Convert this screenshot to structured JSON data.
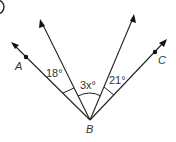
{
  "problem_number_marker": "",
  "vertex": {
    "label": "B",
    "x": 90,
    "y": 120
  },
  "rays": [
    {
      "name": "ray-ba",
      "end": [
        12,
        43
      ],
      "point": {
        "label": "A",
        "at": [
          26,
          56
        ],
        "label_at": [
          19,
          68
        ]
      }
    },
    {
      "name": "ray-left-inner",
      "end": [
        40,
        20
      ]
    },
    {
      "name": "ray-right-inner",
      "end": [
        134,
        15
      ]
    },
    {
      "name": "ray-bc",
      "end": [
        166,
        40
      ],
      "point": {
        "label": "C",
        "at": [
          155,
          52
        ],
        "label_at": [
          161,
          62
        ]
      }
    }
  ],
  "angles": [
    {
      "name": "angle-left",
      "label": "18°"
    },
    {
      "name": "angle-middle",
      "label": "3x°"
    },
    {
      "name": "angle-right",
      "label": "21°"
    }
  ],
  "colors": {
    "line": "#222222",
    "text": "#333333",
    "background": "#ffffff"
  }
}
